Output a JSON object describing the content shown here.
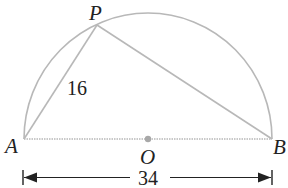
{
  "diagram": {
    "type": "geometry",
    "colors": {
      "figure_stroke": "#b8b8b8",
      "center_dot": "#a8a8a8",
      "text": "#222222",
      "dimension_line": "#222222"
    },
    "points": {
      "A": {
        "label": "A",
        "x": 24,
        "y": 139
      },
      "B": {
        "label": "B",
        "x": 272,
        "y": 139
      },
      "O": {
        "label": "O",
        "x": 148,
        "y": 139
      },
      "P": {
        "label": "P",
        "x": 97,
        "y": 25
      }
    },
    "segments": [
      {
        "from": "A",
        "to": "P",
        "length_label": "16"
      },
      {
        "from": "P",
        "to": "B",
        "length_label": ""
      },
      {
        "from": "A",
        "to": "B",
        "length_label": "",
        "style": "dotted"
      }
    ],
    "arc": {
      "center": "O",
      "type": "semicircle",
      "rx": 124,
      "ry": 126
    },
    "labels": {
      "P": "P",
      "A": "A",
      "B": "B",
      "O": "O",
      "AP_length": "16",
      "diameter_length": "34"
    },
    "dimension": {
      "label": "34",
      "from_x": 24,
      "to_x": 272,
      "y": 177
    }
  }
}
